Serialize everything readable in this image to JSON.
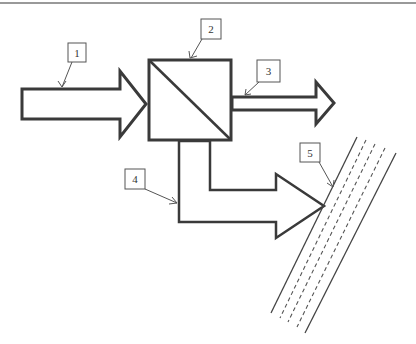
{
  "diagram": {
    "type": "optical-schematic",
    "colors": {
      "stroke": "#3a3a3a",
      "label_stroke": "#555555",
      "background": "#ffffff"
    },
    "labels": [
      {
        "id": "1",
        "text": "1",
        "refers_to": "incident beam arrow"
      },
      {
        "id": "2",
        "text": "2",
        "refers_to": "beam splitter cube"
      },
      {
        "id": "3",
        "text": "3",
        "refers_to": "transmitted beam arrow"
      },
      {
        "id": "4",
        "text": "4",
        "refers_to": "deflected beam arrow"
      },
      {
        "id": "5",
        "text": "5",
        "refers_to": "layered target / slab"
      }
    ]
  }
}
